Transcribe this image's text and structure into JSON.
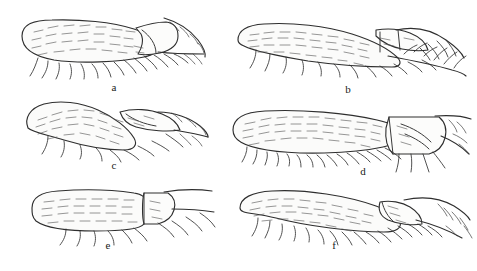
{
  "figure": {
    "type": "scientific-line-drawing-plate",
    "background_color": "#ffffff",
    "ink_color": "#2e2e2e",
    "pubescence_color": "#565656",
    "width": 477,
    "height": 271,
    "columns": 2,
    "rows": 3
  },
  "panels": [
    {
      "id": "a",
      "label": "a",
      "label_x": 104,
      "label_y": 82,
      "row": 1,
      "column": 1,
      "origin_x": 8,
      "origin_y": 10,
      "description": "elongate oval pubescent lobe, apex directed right, with short trapezoidal distal segment and long curved marginal setae along ventral margin",
      "body_length": 120,
      "body_height": 42,
      "distal_segment": "short-trapezoid",
      "seta_count_ventral": 14,
      "seta_count_apical": 6
    },
    {
      "id": "b",
      "label": "b",
      "label_x": 348,
      "label_y": 84,
      "row": 1,
      "column": 2,
      "origin_x": 228,
      "origin_y": 8,
      "description": "long curved pubescent lobe, tapering apically, distal segment narrow and strongly curved upward with cross-set barbed setae along the apical margin",
      "body_length": 150,
      "body_height": 46,
      "distal_segment": "narrow-curved",
      "seta_count_ventral": 12,
      "seta_count_apical": 10
    },
    {
      "id": "c",
      "label": "c",
      "label_x": 104,
      "label_y": 163,
      "row": 2,
      "column": 1,
      "origin_x": 14,
      "origin_y": 96,
      "description": "short broad pubescent lobe angled obliquely upward, abruptly truncate, with a sharply recurved apical segment and sparse long ventral setae",
      "body_length": 104,
      "body_height": 44,
      "distal_segment": "recurved-hook",
      "seta_count_ventral": 9,
      "seta_count_apical": 5
    },
    {
      "id": "d",
      "label": "d",
      "label_x": 362,
      "label_y": 170,
      "row": 2,
      "column": 2,
      "origin_x": 225,
      "origin_y": 100,
      "description": "long slender pubescent lobe with densely setose ventral margin and a large well-defined quadrate distal segment bearing divergent stout setae",
      "body_length": 152,
      "body_height": 44,
      "distal_segment": "large-quadrate",
      "seta_count_ventral": 20,
      "seta_count_apical": 7
    },
    {
      "id": "e",
      "label": "e",
      "label_x": 104,
      "label_y": 240,
      "row": 3,
      "column": 1,
      "origin_x": 22,
      "origin_y": 183,
      "description": "blunt rounded-rectangular pubescent lobe, broadly truncate apically, with a short collar-like distal segment and a few long oblique ventral setae",
      "body_length": 110,
      "body_height": 38,
      "distal_segment": "short-collar",
      "seta_count_ventral": 8,
      "seta_count_apical": 4
    },
    {
      "id": "f",
      "label": "f",
      "label_x": 333,
      "label_y": 244,
      "row": 3,
      "column": 2,
      "origin_x": 232,
      "origin_y": 182,
      "description": "broadly falcate pubescent lobe curving downward, with a small wedge-shaped distal segment and dense comb of ventral marginal setae",
      "body_length": 142,
      "body_height": 46,
      "distal_segment": "small-wedge",
      "seta_count_ventral": 16,
      "seta_count_apical": 6
    }
  ]
}
